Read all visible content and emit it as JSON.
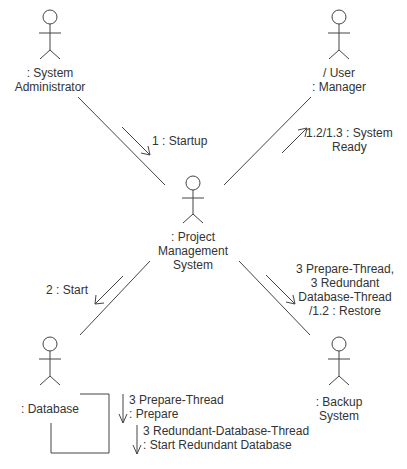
{
  "diagram": {
    "type": "UML communication diagram",
    "actors": [
      {
        "id": "sysadmin",
        "line1": ": System",
        "line2": "Administrator"
      },
      {
        "id": "user-manager",
        "line1": "/ User",
        "line2": ": Manager"
      },
      {
        "id": "pms",
        "line1": ": Project",
        "line2": "Management",
        "line3": "System"
      },
      {
        "id": "database",
        "line1": ": Database"
      },
      {
        "id": "backup",
        "line1": ": Backup",
        "line2": "System"
      }
    ],
    "messages": [
      {
        "id": "startup",
        "text": "1 : Startup"
      },
      {
        "id": "system-ready",
        "line1": "1.2/1.3 : System",
        "line2": "Ready"
      },
      {
        "id": "start",
        "text": "2 : Start"
      },
      {
        "id": "restore",
        "line1": "3 Prepare-Thread,",
        "line2": "3 Redundant",
        "line3": "Database-Thread",
        "line4": "/1.2 : Restore"
      },
      {
        "id": "prepare",
        "line1": "3 Prepare-Thread",
        "line2": ": Prepare"
      },
      {
        "id": "start-redundant",
        "line1": "3 Redundant-Database-Thread",
        "line2": ": Start Redundant Database"
      }
    ]
  }
}
